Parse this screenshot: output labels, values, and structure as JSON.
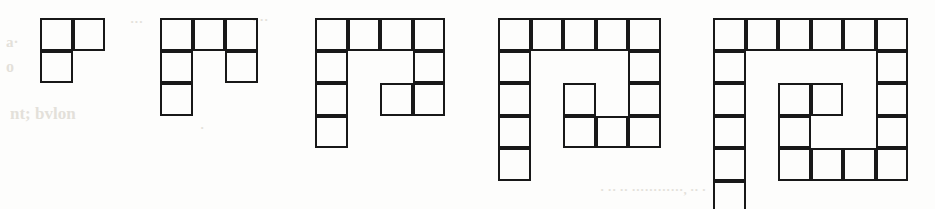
{
  "page": {
    "kind": "figure-strip",
    "background_color": "#fdfdfc",
    "stroke_color": "#181818",
    "stroke_width_px": 2.6,
    "cell_size_px": 32.5,
    "width_px": 935,
    "height_px": 209
  },
  "figures": [
    {
      "id": "figure-1",
      "label": "",
      "cell_count": 3,
      "cols": 2,
      "rows": 2,
      "origin_x": 40,
      "origin_y": 18,
      "cells": [
        {
          "r": 0,
          "c": 0
        },
        {
          "r": 0,
          "c": 1
        },
        {
          "r": 1,
          "c": 0
        }
      ]
    },
    {
      "id": "figure-2",
      "label": "",
      "cell_count": 5,
      "cols": 3,
      "rows": 3,
      "origin_x": 160,
      "origin_y": 18,
      "cells": [
        {
          "r": 0,
          "c": 0
        },
        {
          "r": 0,
          "c": 1
        },
        {
          "r": 0,
          "c": 2
        },
        {
          "r": 1,
          "c": 0
        },
        {
          "r": 1,
          "c": 2
        },
        {
          "r": 2,
          "c": 0
        }
      ]
    },
    {
      "id": "figure-3",
      "label": "",
      "cell_count": 9,
      "cols": 4,
      "rows": 4,
      "origin_x": 315,
      "origin_y": 18,
      "cells": [
        {
          "r": 0,
          "c": 0
        },
        {
          "r": 0,
          "c": 1
        },
        {
          "r": 0,
          "c": 2
        },
        {
          "r": 0,
          "c": 3
        },
        {
          "r": 1,
          "c": 0
        },
        {
          "r": 1,
          "c": 3
        },
        {
          "r": 2,
          "c": 0
        },
        {
          "r": 2,
          "c": 2
        },
        {
          "r": 2,
          "c": 3
        },
        {
          "r": 3,
          "c": 0
        }
      ]
    },
    {
      "id": "figure-4",
      "label": "",
      "cell_count": 14,
      "cols": 5,
      "rows": 5,
      "origin_x": 498,
      "origin_y": 18,
      "cells": [
        {
          "r": 0,
          "c": 0
        },
        {
          "r": 0,
          "c": 1
        },
        {
          "r": 0,
          "c": 2
        },
        {
          "r": 0,
          "c": 3
        },
        {
          "r": 0,
          "c": 4
        },
        {
          "r": 1,
          "c": 0
        },
        {
          "r": 1,
          "c": 4
        },
        {
          "r": 2,
          "c": 0
        },
        {
          "r": 2,
          "c": 2
        },
        {
          "r": 2,
          "c": 4
        },
        {
          "r": 3,
          "c": 0
        },
        {
          "r": 3,
          "c": 2
        },
        {
          "r": 3,
          "c": 3
        },
        {
          "r": 3,
          "c": 4
        },
        {
          "r": 4,
          "c": 0
        }
      ]
    },
    {
      "id": "figure-5",
      "label": "",
      "cell_count": 20,
      "cols": 6,
      "rows": 6,
      "origin_x": 713,
      "origin_y": 18,
      "cells": [
        {
          "r": 0,
          "c": 0
        },
        {
          "r": 0,
          "c": 1
        },
        {
          "r": 0,
          "c": 2
        },
        {
          "r": 0,
          "c": 3
        },
        {
          "r": 0,
          "c": 4
        },
        {
          "r": 0,
          "c": 5
        },
        {
          "r": 1,
          "c": 0
        },
        {
          "r": 1,
          "c": 5
        },
        {
          "r": 2,
          "c": 0
        },
        {
          "r": 2,
          "c": 2
        },
        {
          "r": 2,
          "c": 3
        },
        {
          "r": 2,
          "c": 5
        },
        {
          "r": 3,
          "c": 0
        },
        {
          "r": 3,
          "c": 2
        },
        {
          "r": 3,
          "c": 5
        },
        {
          "r": 4,
          "c": 0
        },
        {
          "r": 4,
          "c": 2
        },
        {
          "r": 4,
          "c": 3
        },
        {
          "r": 4,
          "c": 4
        },
        {
          "r": 4,
          "c": 5
        },
        {
          "r": 5,
          "c": 0
        }
      ]
    }
  ],
  "background_ghost_text": [
    {
      "text": "a·",
      "x": 6,
      "y": 34,
      "size": 15
    },
    {
      "text": "···",
      "x": 130,
      "y": 14,
      "size": 13
    },
    {
      "text": "· ··",
      "x": 252,
      "y": 12,
      "size": 13
    },
    {
      "text": "o",
      "x": 6,
      "y": 58,
      "size": 16
    },
    {
      "text": "nt; bvlon",
      "x": 10,
      "y": 104,
      "size": 17
    },
    {
      "text": "·",
      "x": 200,
      "y": 120,
      "size": 13
    },
    {
      "text": "· ·· ·· ············, ··  ·",
      "x": 600,
      "y": 182,
      "size": 13
    }
  ]
}
